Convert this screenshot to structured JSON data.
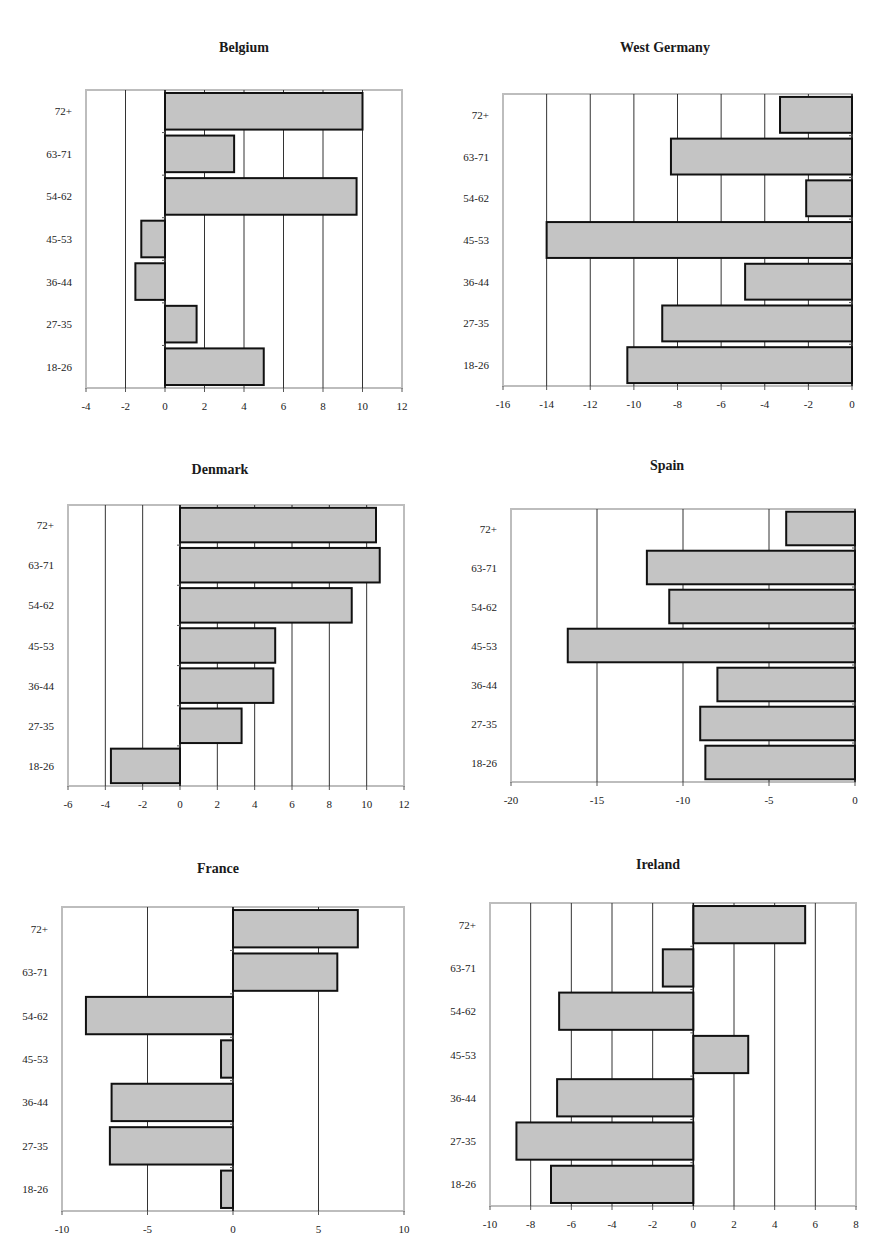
{
  "page": {
    "layout": "3 rows x 2 columns of horizontal bar charts",
    "bar_fill": "#c4c4c4",
    "bar_stroke": "#111111",
    "frame_color": "#bdbdbd",
    "grid_color": "#333333"
  },
  "chart_data": [
    {
      "type": "bar",
      "orientation": "horizontal",
      "title": "Belgium",
      "categories": [
        "72+",
        "63-71",
        "54-62",
        "45-53",
        "36-44",
        "27-35",
        "18-26"
      ],
      "values": [
        10.0,
        3.5,
        9.7,
        -1.2,
        -1.5,
        1.6,
        5.0
      ],
      "xlabel": "",
      "ylabel": "",
      "xlim": [
        -4,
        12
      ],
      "xticks": [
        -4,
        -2,
        0,
        2,
        4,
        6,
        8,
        10,
        12
      ],
      "grid": true,
      "legend": null,
      "box": {
        "x0": 86,
        "x1": 402,
        "y0": 90,
        "y1": 388
      },
      "title_pos": {
        "x": 244,
        "y": 50
      }
    },
    {
      "type": "bar",
      "orientation": "horizontal",
      "title": "West Germany",
      "categories": [
        "72+",
        "63-71",
        "54-62",
        "45-53",
        "36-44",
        "27-35",
        "18-26"
      ],
      "values": [
        -3.3,
        -8.3,
        -2.1,
        -14.0,
        -4.9,
        -8.7,
        -10.3
      ],
      "xlabel": "",
      "ylabel": "",
      "xlim": [
        -16,
        0
      ],
      "xticks": [
        -16,
        -14,
        -12,
        -10,
        -8,
        -6,
        -4,
        -2,
        0
      ],
      "grid": true,
      "legend": null,
      "box": {
        "x0": 503,
        "x1": 852,
        "y0": 94,
        "y1": 386
      },
      "title_pos": {
        "x": 665,
        "y": 50
      }
    },
    {
      "type": "bar",
      "orientation": "horizontal",
      "title": "Denmark",
      "categories": [
        "72+",
        "63-71",
        "54-62",
        "45-53",
        "36-44",
        "27-35",
        "18-26"
      ],
      "values": [
        10.5,
        10.7,
        9.2,
        5.1,
        5.0,
        3.3,
        -3.7
      ],
      "xlabel": "",
      "ylabel": "",
      "xlim": [
        -6,
        12
      ],
      "xticks": [
        -6,
        -4,
        -2,
        0,
        2,
        4,
        6,
        8,
        10,
        12
      ],
      "grid": true,
      "legend": null,
      "box": {
        "x0": 68,
        "x1": 404,
        "y0": 505,
        "y1": 786
      },
      "title_pos": {
        "x": 220,
        "y": 472
      }
    },
    {
      "type": "bar",
      "orientation": "horizontal",
      "title": "Spain",
      "categories": [
        "72+",
        "63-71",
        "54-62",
        "45-53",
        "36-44",
        "27-35",
        "18-26"
      ],
      "values": [
        -4.0,
        -12.1,
        -10.8,
        -16.7,
        -8.0,
        -9.0,
        -8.7
      ],
      "xlabel": "",
      "ylabel": "",
      "xlim": [
        -20,
        0
      ],
      "xticks": [
        -20,
        -15,
        -10,
        -5,
        0
      ],
      "grid": true,
      "legend": null,
      "box": {
        "x0": 511,
        "x1": 855,
        "y0": 509,
        "y1": 782
      },
      "title_pos": {
        "x": 667,
        "y": 468
      }
    },
    {
      "type": "bar",
      "orientation": "horizontal",
      "title": "France",
      "categories": [
        "72+",
        "63-71",
        "54-62",
        "45-53",
        "36-44",
        "27-35",
        "18-26"
      ],
      "values": [
        7.3,
        6.1,
        -8.6,
        -0.7,
        -7.1,
        -7.2,
        -0.7
      ],
      "xlabel": "",
      "ylabel": "",
      "xlim": [
        -10,
        10
      ],
      "xticks": [
        -10,
        -5,
        0,
        5,
        10
      ],
      "grid": true,
      "legend": null,
      "box": {
        "x0": 62,
        "x1": 404,
        "y0": 907,
        "y1": 1211
      },
      "title_pos": {
        "x": 218,
        "y": 871
      }
    },
    {
      "type": "bar",
      "orientation": "horizontal",
      "title": "Ireland",
      "categories": [
        "72+",
        "63-71",
        "54-62",
        "45-53",
        "36-44",
        "27-35",
        "18-26"
      ],
      "values": [
        5.5,
        -1.5,
        -6.6,
        2.7,
        -6.7,
        -8.7,
        -7.0
      ],
      "xlabel": "",
      "ylabel": "",
      "xlim": [
        -10,
        8
      ],
      "xticks": [
        -10,
        -8,
        -6,
        -4,
        -2,
        0,
        2,
        4,
        6,
        8
      ],
      "grid": true,
      "legend": null,
      "box": {
        "x0": 490,
        "x1": 856,
        "y0": 903,
        "y1": 1206
      },
      "title_pos": {
        "x": 658,
        "y": 867
      }
    }
  ]
}
